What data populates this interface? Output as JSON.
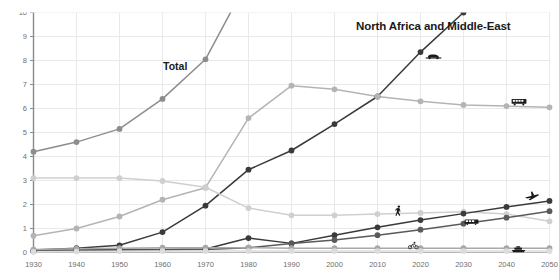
{
  "chart_data": {
    "type": "line",
    "title": "North Africa and Middle-East",
    "xlabel": "",
    "ylabel": "",
    "xlim": [
      1930,
      2050
    ],
    "ylim": [
      0,
      10
    ],
    "grid": true,
    "legend_position": "inline-annotations",
    "x": [
      1930,
      1940,
      1950,
      1960,
      1970,
      1980,
      1990,
      2000,
      2010,
      2020,
      2030,
      2040,
      2050
    ],
    "categories": [
      "1930",
      "1940",
      "1950",
      "1960",
      "1970",
      "1980",
      "1990",
      "2000",
      "2010",
      "2020",
      "2030",
      "2040",
      "2050"
    ],
    "ytick_labels": [
      "0",
      "1",
      "2",
      "3",
      "4",
      "5",
      "6",
      "7",
      "8",
      "9",
      "10"
    ],
    "ytick_values": [
      0,
      1,
      2,
      3,
      4,
      5,
      6,
      7,
      8,
      9,
      10
    ],
    "series": [
      {
        "name": "Total",
        "color": "#8d8d8d",
        "marker": "circle",
        "values": [
          4.2,
          4.6,
          5.15,
          6.4,
          8.05,
          11.4,
          null,
          null,
          null,
          null,
          null,
          null,
          null
        ],
        "annotation": "Total"
      },
      {
        "name": "Car",
        "color": "#3a3a3a",
        "marker": "circle",
        "values": [
          0.1,
          0.18,
          0.3,
          0.85,
          1.95,
          3.45,
          4.25,
          5.35,
          6.5,
          8.35,
          10.0,
          null,
          null
        ],
        "icon": "car-icon"
      },
      {
        "name": "Bus",
        "color": "#b4b4b4",
        "marker": "circle",
        "values": [
          0.7,
          1.0,
          1.5,
          2.2,
          2.7,
          5.6,
          6.95,
          6.8,
          6.5,
          6.3,
          6.15,
          6.1,
          6.05
        ],
        "icon": "bus-icon"
      },
      {
        "name": "Rail",
        "color": "#cfcfcf",
        "marker": "circle",
        "values": [
          3.1,
          3.1,
          3.1,
          2.98,
          2.72,
          1.85,
          1.55,
          1.55,
          1.6,
          1.65,
          1.7,
          1.6,
          1.3
        ],
        "icon": "train-icon"
      },
      {
        "name": "Air",
        "color": "#3a3a3a",
        "marker": "circle",
        "values": [
          0.05,
          0.1,
          0.12,
          0.12,
          0.15,
          0.6,
          0.38,
          0.72,
          1.05,
          1.35,
          1.62,
          1.9,
          2.15
        ],
        "icon": "plane-icon"
      },
      {
        "name": "Two- and three-wheelers",
        "color": "#5a5a5a",
        "marker": "circle",
        "values": [
          0.06,
          0.08,
          0.1,
          0.1,
          0.12,
          0.2,
          0.38,
          0.52,
          0.72,
          0.95,
          1.2,
          1.45,
          1.72
        ],
        "icon": "bicycle-icon"
      },
      {
        "name": "Ship",
        "color": "#a8a8a8",
        "marker": "circle",
        "values": [
          0.12,
          0.16,
          0.18,
          0.2,
          0.2,
          0.2,
          0.18,
          0.18,
          0.18,
          0.18,
          0.18,
          0.18,
          0.18
        ],
        "icon": "boat-icon"
      },
      {
        "name": "Walking",
        "color": "#dcdcdc",
        "marker": "circle",
        "values": [
          0.03,
          0.04,
          0.05,
          0.06,
          0.06,
          0.06,
          0.06,
          0.06,
          0.06,
          0.06,
          0.06,
          0.06,
          0.06
        ],
        "icon": "walking-icon"
      }
    ],
    "annotations": [
      {
        "name": "walking-icon",
        "label": "Walking",
        "x": 2016,
        "y": 1.78
      },
      {
        "name": "car-icon",
        "label": "Car",
        "x": 2023,
        "y": 8.35
      },
      {
        "name": "bus-icon",
        "label": "Bus",
        "x": 2043,
        "y": 6.45
      },
      {
        "name": "plane-icon",
        "label": "Air",
        "x": 2046,
        "y": 2.45
      },
      {
        "name": "train-icon",
        "label": "Rail",
        "x": 2032,
        "y": 1.42
      },
      {
        "name": "bicycle-icon",
        "label": "Two- and three-wheelers",
        "x": 2019,
        "y": 0.42
      },
      {
        "name": "boat-icon",
        "label": "Ship",
        "x": 2043,
        "y": 0.3
      }
    ],
    "colors": {
      "axis": "#8a8a8a",
      "grid": "#e3e3e3",
      "title": "#1a1a1a",
      "tick": "#6e6e6e",
      "background": "#ffffff"
    }
  }
}
